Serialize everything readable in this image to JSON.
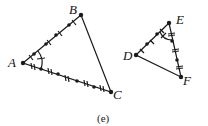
{
  "figure": {
    "caption": "(e)",
    "triangle_abc": {
      "labels": {
        "A": "A",
        "B": "B",
        "C": "C"
      },
      "points": {
        "A": [
          23,
          63
        ],
        "B": [
          81,
          15
        ],
        "C": [
          111,
          92
        ]
      }
    },
    "triangle_def": {
      "labels": {
        "D": "D",
        "E": "E",
        "F": "F"
      },
      "points": {
        "D": [
          136,
          55
        ],
        "E": [
          169,
          23
        ],
        "F": [
          181,
          77
        ]
      }
    },
    "colors": {
      "stroke": "#1a1a1a"
    }
  }
}
